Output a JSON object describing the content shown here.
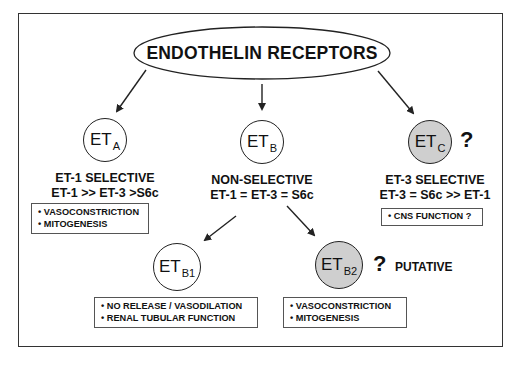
{
  "diagram": {
    "title": "ENDOTHELIN RECEPTORS",
    "nodes": [
      {
        "id": "ETA",
        "main": "ET",
        "sub": "A",
        "filled": false,
        "question": "",
        "selectivity": "ET-1 SELECTIVE",
        "rank_order": "ET-1 >> ET-3 >S6c",
        "functions": [
          "• VASOCONSTRICTION",
          "• MITOGENESIS"
        ]
      },
      {
        "id": "ETB",
        "main": "ET",
        "sub": "B",
        "filled": false,
        "question": "",
        "selectivity": "NON-SELECTIVE",
        "rank_order": "ET-1 = ET-3 = S6c",
        "functions": []
      },
      {
        "id": "ETC",
        "main": "ET",
        "sub": "C",
        "filled": true,
        "question": "?",
        "selectivity": "ET-3 SELECTIVE",
        "rank_order": "ET-3 = S6c >> ET-1",
        "functions": [
          "• CNS FUNCTION ?"
        ]
      },
      {
        "id": "ETB1",
        "main": "ET",
        "sub": "B1",
        "filled": false,
        "question": "",
        "functions": [
          "• NO RELEASE / VASODILATION",
          "• RENAL TUBULAR FUNCTION"
        ]
      },
      {
        "id": "ETB2",
        "main": "ET",
        "sub": "B2",
        "filled": true,
        "question": "?",
        "note": "PUTATIVE",
        "functions": [
          "• VASOCONSTRICTION",
          "• MITOGENESIS"
        ]
      }
    ],
    "edges": [
      {
        "from": "title",
        "to": "ETA"
      },
      {
        "from": "title",
        "to": "ETB"
      },
      {
        "from": "title",
        "to": "ETC"
      },
      {
        "from": "ETB",
        "to": "ETB1"
      },
      {
        "from": "ETB",
        "to": "ETB2"
      }
    ],
    "colors": {
      "line": "#222222",
      "filled_node": "#cfcfcf",
      "background": "#ffffff"
    }
  }
}
